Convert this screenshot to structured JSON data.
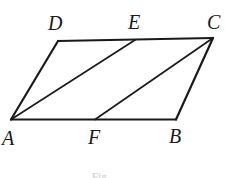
{
  "figure": {
    "type": "geometry-diagram",
    "shape": "parallelogram",
    "name": "parallelogram-abcd",
    "background_color": "#ffffff",
    "stroke_color": "#1a1a1a",
    "label_color": "#1a1a1a",
    "vertices": {
      "A": {
        "label": "A",
        "x": 11,
        "y": 119,
        "label_x": 2,
        "label_y": 128
      },
      "B": {
        "label": "B",
        "x": 176,
        "y": 119,
        "label_x": 169,
        "label_y": 126
      },
      "C": {
        "label": "C",
        "x": 213,
        "y": 38,
        "label_x": 207,
        "label_y": 12
      },
      "D": {
        "label": "D",
        "x": 58,
        "y": 41,
        "label_x": 48,
        "label_y": 13
      },
      "E": {
        "label": "E",
        "x": 135,
        "y": 40,
        "label_x": 128,
        "label_y": 12
      },
      "F": {
        "label": "F",
        "x": 95,
        "y": 119,
        "label_x": 88,
        "label_y": 127
      }
    },
    "edges": [
      {
        "name": "edge-AB",
        "from": "A",
        "to": "B"
      },
      {
        "name": "edge-BC",
        "from": "B",
        "to": "C"
      },
      {
        "name": "edge-DC",
        "from": "D",
        "to": "C"
      },
      {
        "name": "edge-AD",
        "from": "A",
        "to": "D"
      }
    ],
    "diagonals": [
      {
        "name": "segment-AE",
        "from": "A",
        "to": "E"
      },
      {
        "name": "segment-FC",
        "from": "F",
        "to": "C"
      }
    ],
    "caption": "Fig."
  }
}
